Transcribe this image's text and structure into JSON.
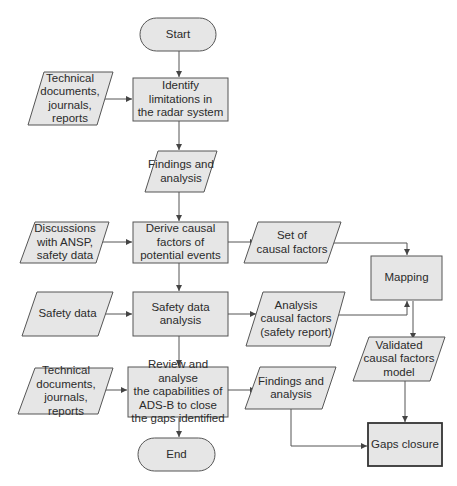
{
  "diagram": {
    "type": "flowchart",
    "colors": {
      "fill": "#e6e6e6",
      "stroke": "#555555",
      "text": "#2b2b2b",
      "background": "#ffffff"
    },
    "nodes": {
      "start": {
        "shape": "terminator",
        "label": "Start"
      },
      "identify": {
        "shape": "process",
        "label": "Identify\nlimitations in\nthe radar system"
      },
      "input_tech_docs_1": {
        "shape": "data",
        "label": "Technical\ndocuments,\njournals,\nreports"
      },
      "findings_1": {
        "shape": "data",
        "label": "Findings and\nanalysis"
      },
      "input_discussions": {
        "shape": "data",
        "label": "Discussions\nwith ANSP,\nsafety data"
      },
      "derive": {
        "shape": "process",
        "label": "Derive causal\nfactors of\npotential events"
      },
      "set_causal": {
        "shape": "data",
        "label": "Set of\ncausal factors"
      },
      "mapping": {
        "shape": "process",
        "label": "Mapping"
      },
      "input_safety": {
        "shape": "data",
        "label": "Safety data"
      },
      "safety_analysis": {
        "shape": "process",
        "label": "Safety data\nanalysis"
      },
      "analysis_causal": {
        "shape": "data",
        "label": "Analysis\ncausal factors\n(safety report)"
      },
      "validated": {
        "shape": "data",
        "label": "Validated\ncausal factors\nmodel"
      },
      "input_tech_docs_2": {
        "shape": "data",
        "label": "Technical\ndocuments,\njournals,\nreports"
      },
      "review": {
        "shape": "process",
        "label": "Review and analyse\nthe capabilities of\nADS-B to close\nthe gaps identified"
      },
      "findings_2": {
        "shape": "data",
        "label": "Findings and\nanalysis"
      },
      "end": {
        "shape": "terminator",
        "label": "End"
      },
      "gaps": {
        "shape": "process",
        "label": "Gaps closure"
      }
    },
    "edges": [
      [
        "start",
        "identify"
      ],
      [
        "input_tech_docs_1",
        "identify"
      ],
      [
        "identify",
        "findings_1"
      ],
      [
        "findings_1",
        "derive"
      ],
      [
        "input_discussions",
        "derive"
      ],
      [
        "derive",
        "set_causal"
      ],
      [
        "set_causal",
        "mapping"
      ],
      [
        "derive",
        "safety_analysis"
      ],
      [
        "input_safety",
        "safety_analysis"
      ],
      [
        "safety_analysis",
        "analysis_causal"
      ],
      [
        "analysis_causal",
        "mapping"
      ],
      [
        "mapping",
        "validated"
      ],
      [
        "safety_analysis",
        "review"
      ],
      [
        "input_tech_docs_2",
        "review"
      ],
      [
        "review",
        "findings_2"
      ],
      [
        "review",
        "end"
      ],
      [
        "findings_2",
        "gaps"
      ],
      [
        "validated",
        "gaps"
      ]
    ]
  }
}
